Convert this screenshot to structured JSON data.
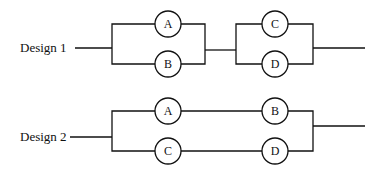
{
  "designs": [
    {
      "label": "Design 1",
      "topology": "series of two parallel pairs",
      "components": [
        "A",
        "B",
        "C",
        "D"
      ],
      "stage1": {
        "top": "A",
        "bottom": "B"
      },
      "stage2": {
        "top": "C",
        "bottom": "D"
      }
    },
    {
      "label": "Design 2",
      "topology": "parallel of two series chains",
      "components": [
        "A",
        "B",
        "C",
        "D"
      ],
      "top_chain": [
        "A",
        "B"
      ],
      "bottom_chain": [
        "C",
        "D"
      ]
    }
  ],
  "colors": {
    "line": "#111111",
    "background": "#ffffff"
  }
}
